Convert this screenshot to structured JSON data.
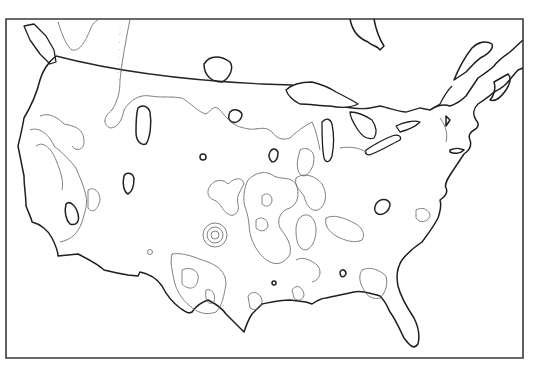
{
  "map": {
    "title": "",
    "region": "Conterminous United States",
    "type": "hachured contour map",
    "colors": {
      "background": "#ffffff",
      "frame": "#3a3a3a",
      "coastline": "#1e1e1e",
      "contour": "#666666"
    },
    "labels": []
  }
}
